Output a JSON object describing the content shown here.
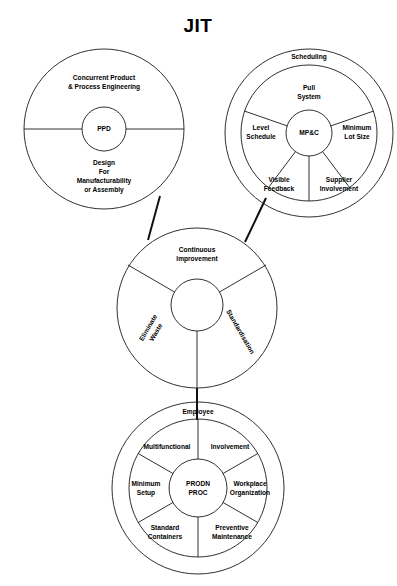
{
  "title": "JIT",
  "colors": {
    "stroke": "#1a1a1a",
    "text": "#000000",
    "background": "#ffffff",
    "connector": "#111111"
  },
  "diagram": {
    "type": "concept-wheel-diagram",
    "wheels": [
      {
        "id": "ppd",
        "name": "Product / Process Design Wheel",
        "center_label": "PPD",
        "sectors": [
          {
            "label_line1": "Concurrent Product",
            "label_line2": "& Process Engineering",
            "position": "top"
          },
          {
            "label_line1": "Design",
            "label_line2": "For",
            "label_line3": "Manufacturability",
            "label_line4": "or Assembly",
            "position": "bottom"
          }
        ]
      },
      {
        "id": "mpc",
        "name": "Manufacturing Planning & Control Wheel",
        "center_label": "MP&C",
        "ring_label": "Scheduling",
        "sectors": [
          {
            "label_line1": "Pull",
            "label_line2": "System",
            "position": "top"
          },
          {
            "label_line1": "Minimum",
            "label_line2": "Lot Size",
            "position": "right"
          },
          {
            "label_line1": "Supplier",
            "label_line2": "Involvement",
            "position": "bottom-right"
          },
          {
            "label_line1": "Visible",
            "label_line2": "Feedback",
            "position": "bottom-left"
          },
          {
            "label_line1": "Level",
            "label_line2": "Schedule",
            "position": "left"
          }
        ]
      },
      {
        "id": "continuous",
        "name": "Continuous Improvement Wheel",
        "center_label": "",
        "sectors": [
          {
            "label_line1": "Continuous",
            "label_line2": "Improvement",
            "position": "top",
            "rotation": 0
          },
          {
            "label_line1": "Eliminate",
            "label_line2": "Waste",
            "position": "bottom-left",
            "rotation": -60
          },
          {
            "label_line1": "Standardisation",
            "position": "bottom-right",
            "rotation": 60
          }
        ]
      },
      {
        "id": "prodn",
        "name": "Production Process Wheel",
        "center_label_line1": "PRODN",
        "center_label_line2": "PROC",
        "ring_label": "Employee",
        "sectors": [
          {
            "label_line1": "Multifunctional",
            "position": "top-left"
          },
          {
            "label_line1": "Involvement",
            "position": "top-right"
          },
          {
            "label_line1": "Workplace",
            "label_line2": "Organization",
            "position": "right"
          },
          {
            "label_line1": "Preventive",
            "label_line2": "Maintenance",
            "position": "bottom-right"
          },
          {
            "label_line1": "Standard",
            "label_line2": "Containers",
            "position": "bottom-left"
          },
          {
            "label_line1": "Minimum",
            "label_line2": "Setup",
            "position": "left"
          }
        ]
      }
    ],
    "connectors": [
      {
        "from": "ppd",
        "to": "continuous"
      },
      {
        "from": "mpc",
        "to": "continuous"
      },
      {
        "from": "continuous",
        "to": "prodn"
      }
    ]
  }
}
